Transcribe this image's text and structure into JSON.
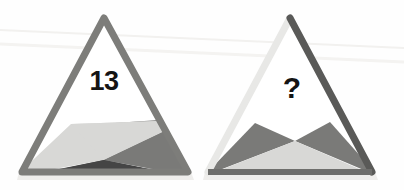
{
  "scene": {
    "title": "Triangle Pattern Puzzle",
    "background_color": "#fefefe",
    "width": 404,
    "height": 190
  },
  "palette": {
    "white_fill": "#ffffff",
    "light_gray": "#d8d8d6",
    "mid_gray": "#7a7a78",
    "dark_gray": "#454545",
    "border_mid": "#7d7d7a",
    "border_light": "#e8e8e6",
    "border_dark": "#5a5a58",
    "shadow_gray": "#efeeec",
    "text_color": "#141414",
    "scanline_color": "#f0efed"
  },
  "figures": [
    {
      "id": "figure-left",
      "name": "left-triangle",
      "label": "13",
      "label_kind": "number",
      "apex": [
        104,
        18
      ],
      "base_left": [
        22,
        172
      ],
      "base_right": [
        188,
        172
      ],
      "border_style": "uniform-mid-gray",
      "pattern": "split-fan",
      "regions": [
        {
          "name": "upper-white-region",
          "color": "#ffffff"
        },
        {
          "name": "left-light-wedge",
          "color": "#d8d8d6"
        },
        {
          "name": "right-mid-wedge",
          "color": "#7a7a78"
        },
        {
          "name": "bottom-dark-triangle",
          "color": "#454545"
        }
      ]
    },
    {
      "id": "figure-right",
      "name": "right-triangle",
      "label": "?",
      "label_kind": "unknown",
      "apex": [
        290,
        18
      ],
      "base_left": [
        208,
        172
      ],
      "base_right": [
        372,
        172
      ],
      "border_style": "light-left-dark-right",
      "pattern": "bowtie-cross",
      "cross_point": [
        295,
        141
      ],
      "regions": [
        {
          "name": "upper-white-region",
          "color": "#ffffff"
        },
        {
          "name": "left-dark-triangle",
          "color": "#7a7a78"
        },
        {
          "name": "right-dark-triangle",
          "color": "#7a7a78"
        },
        {
          "name": "bottom-light-triangle",
          "color": "#d8d8d6"
        }
      ]
    }
  ]
}
